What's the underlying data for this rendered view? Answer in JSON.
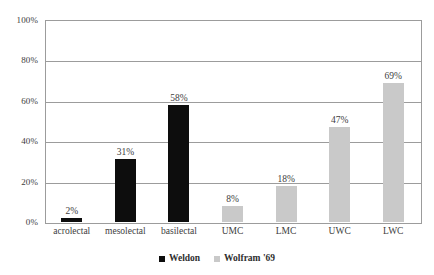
{
  "chart_data": {
    "type": "bar",
    "title": "",
    "subtitle": "",
    "xlabel": "",
    "ylabel": "",
    "categories": [
      "acrolectal",
      "mesolectal",
      "basilectal",
      "UMC",
      "LMC",
      "UWC",
      "LWC"
    ],
    "series": [
      {
        "name": "Weldon",
        "color": "#0d0d0d",
        "values": [
          2,
          31,
          58,
          null,
          null,
          null,
          null
        ],
        "data_labels": [
          "2%",
          "31%",
          "58%",
          "",
          "",
          "",
          ""
        ]
      },
      {
        "name": "Wolfram '69",
        "color": "#c9c9c9",
        "values": [
          null,
          null,
          null,
          8,
          18,
          47,
          69
        ],
        "data_labels": [
          "",
          "",
          "",
          "8%",
          "18%",
          "47%",
          "69%"
        ]
      }
    ],
    "bars": [
      {
        "category": "acrolectal",
        "series": "Weldon",
        "value": 2,
        "label": "2%",
        "color": "#0d0d0d"
      },
      {
        "category": "mesolectal",
        "series": "Weldon",
        "value": 31,
        "label": "31%",
        "color": "#0d0d0d"
      },
      {
        "category": "basilectal",
        "series": "Weldon",
        "value": 58,
        "label": "58%",
        "color": "#0d0d0d"
      },
      {
        "category": "UMC",
        "series": "Wolfram '69",
        "value": 8,
        "label": "8%",
        "color": "#c9c9c9"
      },
      {
        "category": "LMC",
        "series": "Wolfram '69",
        "value": 18,
        "label": "18%",
        "color": "#c9c9c9"
      },
      {
        "category": "UWC",
        "series": "Wolfram '69",
        "value": 47,
        "label": "47%",
        "color": "#c9c9c9"
      },
      {
        "category": "LWC",
        "series": "Wolfram '69",
        "value": 69,
        "label": "69%",
        "color": "#c9c9c9"
      }
    ],
    "ylim": [
      0,
      100
    ],
    "ytick_values": [
      100,
      80,
      60,
      40,
      20,
      0
    ],
    "ytick_labels": [
      "100%",
      "80%",
      "60%",
      "40%",
      "20%",
      "0%"
    ],
    "gridlines": [
      100,
      80,
      60,
      40,
      20,
      0
    ],
    "grid": true,
    "grid_color": "#9c9c9c",
    "frame": true,
    "legend": {
      "position": "bottom-center",
      "entries": [
        {
          "label": "Weldon",
          "color": "#0d0d0d"
        },
        {
          "label": "Wolfram '69",
          "color": "#c9c9c9"
        }
      ]
    },
    "background": "#ffffff"
  }
}
